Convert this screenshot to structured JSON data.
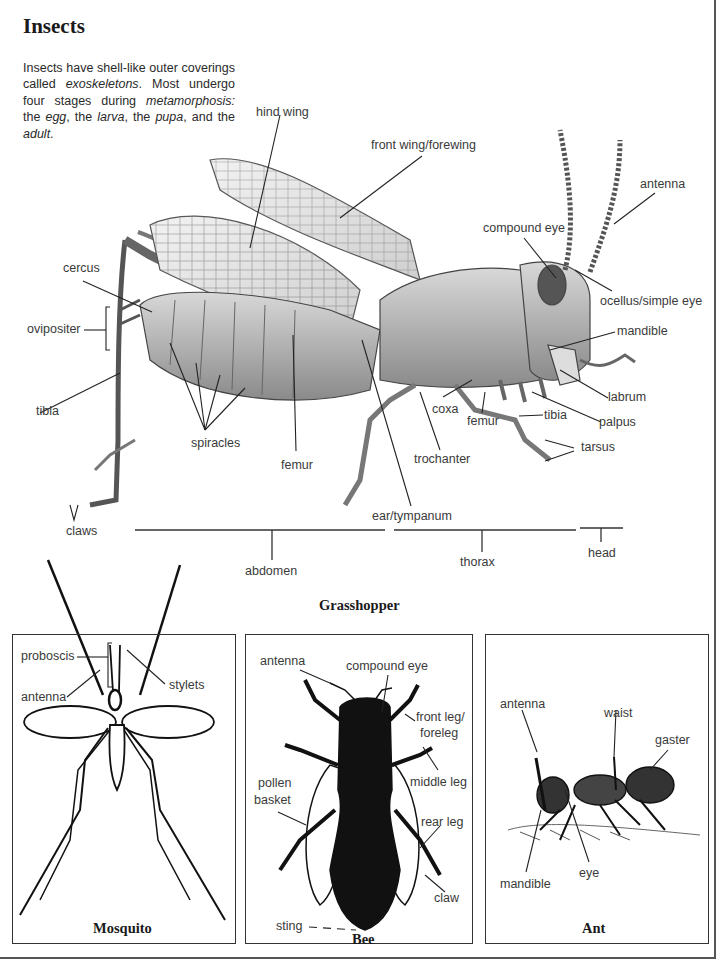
{
  "section": {
    "title": "Insects",
    "intro": [
      {
        "text": "Insects have shell-like outer coverings called ",
        "italic": false
      },
      {
        "text": "exoskeletons",
        "italic": true
      },
      {
        "text": ". Most undergo four stages during ",
        "italic": false
      },
      {
        "text": "metamorphosis:",
        "italic": true
      },
      {
        "text": " the ",
        "italic": false
      },
      {
        "text": "egg",
        "italic": true
      },
      {
        "text": ", the ",
        "italic": false
      },
      {
        "text": "larva",
        "italic": true
      },
      {
        "text": ", the ",
        "italic": false
      },
      {
        "text": "pupa",
        "italic": true
      },
      {
        "text": ", and the ",
        "italic": false
      },
      {
        "text": "adult",
        "italic": true
      },
      {
        "text": ".",
        "italic": false
      }
    ]
  },
  "grasshopper": {
    "caption": "Grasshopper",
    "labels": {
      "hind_wing": "hind wing",
      "front_wing": "front wing/forewing",
      "antenna": "antenna",
      "compound_eye": "compound eye",
      "cercus": "cercus",
      "ocellus": "ocellus/simple eye",
      "oviposter": "ovipositer",
      "mandible": "mandible",
      "labrum": "labrum",
      "tibia_left": "tibia",
      "coxa": "coxa",
      "femur_front": "femur",
      "tibia_front": "tibia",
      "palpus": "palpus",
      "spiracles": "spiracles",
      "femur_mid": "femur",
      "trochanter": "trochanter",
      "tarsus": "tarsus",
      "ear": "ear/tympanum",
      "claws": "claws"
    },
    "segments": {
      "abdomen": "abdomen",
      "thorax": "thorax",
      "head": "head"
    }
  },
  "mosquito": {
    "caption": "Mosquito",
    "labels": {
      "proboscis": "proboscis",
      "stylets": "stylets",
      "antenna": "antenna"
    }
  },
  "bee": {
    "caption": "Bee",
    "labels": {
      "antenna": "antenna",
      "compound_eye": "compound eye",
      "front_leg": "front leg/",
      "foreleg": "foreleg",
      "middle_leg": "middle leg",
      "pollen": "pollen",
      "basket": "basket",
      "rear_leg": "rear leg",
      "claw": "claw",
      "sting": "sting"
    }
  },
  "ant": {
    "caption": "Ant",
    "labels": {
      "antenna": "antenna",
      "waist": "waist",
      "gaster": "gaster",
      "eye": "eye",
      "mandible": "mandible"
    }
  }
}
